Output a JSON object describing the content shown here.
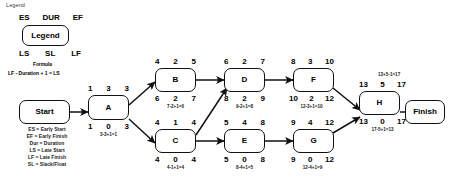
{
  "diagram": {
    "caption": "Legend",
    "legend": {
      "box_label": "Legend",
      "header_top": [
        "ES",
        "DUR",
        "EF"
      ],
      "header_bottom": [
        "LS",
        "SL",
        "LF"
      ],
      "formula_title": "Formula",
      "formula_text": "LF - Duration + 1 = LS",
      "definitions": [
        "ES = Early Start",
        "EF = Early Finish",
        "Dur = Duration",
        "LS = Late Start",
        "LF = Late Finish",
        "SL = Slack/Float"
      ]
    },
    "terminals": {
      "start": "Start",
      "finish": "Finish"
    },
    "nodes": [
      {
        "id": "A",
        "label": "A",
        "early": {
          "es": "1",
          "dur": "3",
          "ef": "3"
        },
        "late": {
          "ls": "1",
          "sl": "0",
          "lf": "3"
        },
        "back_formula": "3-3+1=1",
        "forward_formula": ""
      },
      {
        "id": "B",
        "label": "B",
        "early": {
          "es": "4",
          "dur": "2",
          "ef": "5"
        },
        "late": {
          "ls": "6",
          "sl": "2",
          "lf": "7"
        },
        "back_formula": "7-2+1=6",
        "forward_formula": ""
      },
      {
        "id": "C",
        "label": "C",
        "early": {
          "es": "4",
          "dur": "1",
          "ef": "4"
        },
        "late": {
          "ls": "4",
          "sl": "0",
          "lf": "4"
        },
        "back_formula": "4-1+1=4",
        "forward_formula": ""
      },
      {
        "id": "D",
        "label": "D",
        "early": {
          "es": "6",
          "dur": "2",
          "ef": "7"
        },
        "late": {
          "ls": "8",
          "sl": "2",
          "lf": "9"
        },
        "back_formula": "9-2+1=8",
        "forward_formula": ""
      },
      {
        "id": "E",
        "label": "E",
        "early": {
          "es": "5",
          "dur": "4",
          "ef": "8"
        },
        "late": {
          "ls": "5",
          "sl": "0",
          "lf": "8"
        },
        "back_formula": "8-4+1=5",
        "forward_formula": ""
      },
      {
        "id": "F",
        "label": "F",
        "early": {
          "es": "8",
          "dur": "3",
          "ef": "10"
        },
        "late": {
          "ls": "10",
          "sl": "2",
          "lf": "12"
        },
        "back_formula": "12-3+1=10",
        "forward_formula": ""
      },
      {
        "id": "G",
        "label": "G",
        "early": {
          "es": "9",
          "dur": "4",
          "ef": "12"
        },
        "late": {
          "ls": "9",
          "sl": "0",
          "lf": "12"
        },
        "back_formula": "12-4+1=9",
        "forward_formula": ""
      },
      {
        "id": "H",
        "label": "H",
        "early": {
          "es": "13",
          "dur": "5",
          "ef": "17"
        },
        "late": {
          "ls": "13",
          "sl": "0",
          "lf": "17"
        },
        "back_formula": "17-5+1=13",
        "forward_formula": "13+5-1=17"
      }
    ],
    "edges": [
      {
        "from": "Start",
        "to": "A"
      },
      {
        "from": "A",
        "to": "B"
      },
      {
        "from": "A",
        "to": "C"
      },
      {
        "from": "B",
        "to": "D"
      },
      {
        "from": "C",
        "to": "D"
      },
      {
        "from": "C",
        "to": "E"
      },
      {
        "from": "D",
        "to": "F"
      },
      {
        "from": "E",
        "to": "G"
      },
      {
        "from": "F",
        "to": "H"
      },
      {
        "from": "G",
        "to": "H"
      },
      {
        "from": "H",
        "to": "Finish"
      }
    ]
  }
}
